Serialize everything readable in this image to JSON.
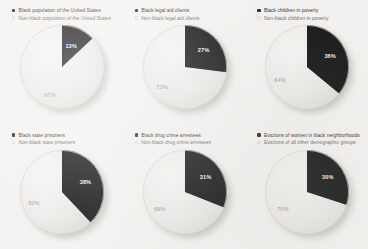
{
  "figure": {
    "background_color": "#f3f2f0",
    "dark_slice_color": "#181818",
    "light_slice_color": "#ececea"
  },
  "panels": [
    {
      "legend_dark": "Black population of the United States",
      "legend_light": "Non-black population of the United States",
      "dark_pct_label": "13%",
      "light_pct_label": "87%"
    },
    {
      "legend_dark": "Black legal aid clients",
      "legend_light": "Non-black legal aid clients",
      "dark_pct_label": "27%",
      "light_pct_label": "73%"
    },
    {
      "legend_dark": "Black children in poverty",
      "legend_light": "Non-black children in poverty",
      "dark_pct_label": "36%",
      "light_pct_label": "64%"
    },
    {
      "legend_dark": "Black state prisoners",
      "legend_light": "Non-black state prisoners",
      "dark_pct_label": "38%",
      "light_pct_label": "62%"
    },
    {
      "legend_dark": "Black drug crime arrestees",
      "legend_light": "Non-black drug crime arrestees",
      "dark_pct_label": "31%",
      "light_pct_label": "69%"
    },
    {
      "legend_dark": "Evictions of women in black neighborhoods",
      "legend_light": "Evictions of all other demographic groups",
      "dark_pct_label": "30%",
      "light_pct_label": "70%"
    }
  ],
  "chart_data": [
    {
      "type": "pie",
      "title": "Black population of the United States",
      "labels": [
        "Black population of the United States",
        "Non-black population of the United States"
      ],
      "values": [
        13,
        87
      ],
      "colors": [
        "#181818",
        "#ececea"
      ],
      "start_angle": 90,
      "direction": "clockwise",
      "units": "percent"
    },
    {
      "type": "pie",
      "title": "Black legal aid clients",
      "labels": [
        "Black legal aid clients",
        "Non-black legal aid clients"
      ],
      "values": [
        27,
        73
      ],
      "colors": [
        "#181818",
        "#ececea"
      ],
      "start_angle": 90,
      "direction": "clockwise",
      "units": "percent"
    },
    {
      "type": "pie",
      "title": "Black children in poverty",
      "labels": [
        "Black children in poverty",
        "Non-black children in poverty"
      ],
      "values": [
        36,
        64
      ],
      "colors": [
        "#181818",
        "#ececea"
      ],
      "start_angle": 90,
      "direction": "clockwise",
      "units": "percent"
    },
    {
      "type": "pie",
      "title": "Black state prisoners",
      "labels": [
        "Black state prisoners",
        "Non-black state prisoners"
      ],
      "values": [
        38,
        62
      ],
      "colors": [
        "#181818",
        "#ececea"
      ],
      "start_angle": 90,
      "direction": "clockwise",
      "units": "percent"
    },
    {
      "type": "pie",
      "title": "Black drug crime arrestees",
      "labels": [
        "Black drug crime arrestees",
        "Non-black drug crime arrestees"
      ],
      "values": [
        31,
        69
      ],
      "colors": [
        "#181818",
        "#ececea"
      ],
      "start_angle": 90,
      "direction": "clockwise",
      "units": "percent"
    },
    {
      "type": "pie",
      "title": "Evictions of women in black neighborhoods",
      "labels": [
        "Evictions of women in black neighborhoods",
        "Evictions of all other demographic groups"
      ],
      "values": [
        30,
        70
      ],
      "colors": [
        "#181818",
        "#ececea"
      ],
      "start_angle": 90,
      "direction": "clockwise",
      "units": "percent"
    }
  ]
}
